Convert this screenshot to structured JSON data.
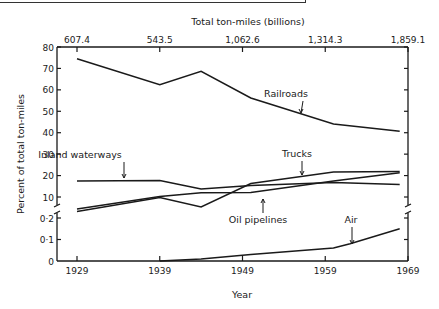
{
  "chart_data": {
    "type": "line",
    "title": "",
    "top_axis_label": "Total ton-miles (billions)",
    "top_axis_ticks": [
      {
        "year": 1929,
        "label": "607.4"
      },
      {
        "year": 1939,
        "label": "543.5"
      },
      {
        "year": 1949,
        "label": "1,062.6"
      },
      {
        "year": 1959,
        "label": "1,314.3"
      },
      {
        "year": 1969,
        "label": "1,859.1"
      }
    ],
    "xlabel": "Year",
    "ylabel": "Percent of total ton-miles",
    "x_ticks": [
      "1929",
      "1939",
      "1949",
      "1959",
      "1969"
    ],
    "xlim": [
      1929,
      1969
    ],
    "y_ticks_upper": [
      "80",
      "70",
      "60",
      "50",
      "40",
      "30",
      "20",
      "10"
    ],
    "y_ticks_lower": [
      "0·2",
      "0·1",
      "0"
    ],
    "ylim_upper": [
      10,
      80
    ],
    "ylim_lower": [
      0,
      0.2
    ],
    "axis_break": true,
    "grid": false,
    "legend": "inline labels with arrows",
    "series": [
      {
        "name": "Railroads",
        "x": [
          1929,
          1939,
          1944,
          1950,
          1960,
          1968
        ],
        "values": [
          74.5,
          62.4,
          68.6,
          56.2,
          44.1,
          40.7
        ]
      },
      {
        "name": "Trucks",
        "x": [
          1929,
          1939,
          1944,
          1950,
          1960,
          1968
        ],
        "values": [
          3.3,
          9.7,
          5.4,
          16.3,
          21.7,
          21.9
        ]
      },
      {
        "name": "Inland waterways",
        "x": [
          1929,
          1939,
          1944,
          1950,
          1960,
          1968
        ],
        "values": [
          17.4,
          17.7,
          13.8,
          15.4,
          16.7,
          15.9
        ]
      },
      {
        "name": "Oil pipelines",
        "x": [
          1929,
          1939,
          1944,
          1950,
          1960,
          1968
        ],
        "values": [
          4.4,
          10.2,
          12.0,
          12.1,
          17.4,
          21.3
        ]
      },
      {
        "name": "Air",
        "x": [
          1939,
          1944,
          1950,
          1960,
          1962,
          1968
        ],
        "values": [
          0.0,
          0.01,
          0.03,
          0.06,
          0.08,
          0.15
        ]
      }
    ],
    "annotations": [
      "Railroads",
      "Trucks",
      "Inland waterways",
      "Oil pipelines",
      "Air"
    ]
  }
}
